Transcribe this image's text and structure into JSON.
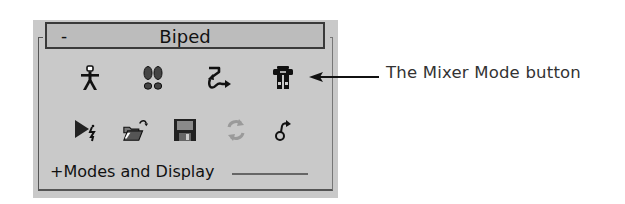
{
  "rollout": {
    "collapse_symbol": "-",
    "title": "Biped"
  },
  "toolbar": {
    "row1": [
      {
        "name": "figure-mode-icon",
        "tooltip": "Figure Mode"
      },
      {
        "name": "footstep-mode-icon",
        "tooltip": "Footstep Mode"
      },
      {
        "name": "motion-flow-mode-icon",
        "tooltip": "Motion Flow Mode"
      },
      {
        "name": "mixer-mode-icon",
        "tooltip": "Mixer Mode"
      }
    ],
    "row2": [
      {
        "name": "biped-playback-icon",
        "tooltip": "Biped Playback"
      },
      {
        "name": "load-file-icon",
        "tooltip": "Load File"
      },
      {
        "name": "save-file-icon",
        "tooltip": "Save File"
      },
      {
        "name": "convert-icon",
        "tooltip": "Convert",
        "disabled": true
      },
      {
        "name": "move-all-mode-icon",
        "tooltip": "Move All Mode"
      }
    ]
  },
  "subrollout": {
    "label": "+Modes and Display"
  },
  "callout": {
    "text": "The Mixer Mode button"
  },
  "colors": {
    "panel_bg": "#c9c9c9",
    "header_bg": "#bcbcbc",
    "header_border": "#3a3a3a",
    "icon_dark": "#111111",
    "icon_disabled": "#9a9a9a",
    "callout_text": "#333333"
  }
}
